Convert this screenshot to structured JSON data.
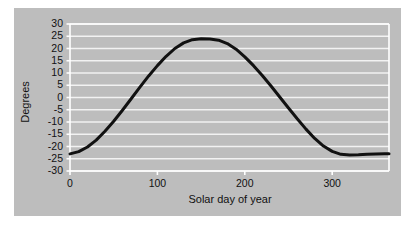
{
  "figure": {
    "background_color": "#ffffff",
    "panel_color": "#bdbdbd",
    "grid_color": "#f2f2f2",
    "axis_color": "#ffffff",
    "line_color": "#111111",
    "text_color": "#111111"
  },
  "chart_data": {
    "type": "line",
    "title": "",
    "subtitle": "",
    "xlabel": "Solar day of year",
    "ylabel": "Degrees",
    "xlim": [
      0,
      365
    ],
    "ylim": [
      -30,
      30
    ],
    "xticks": [
      0,
      100,
      200,
      300
    ],
    "xtick_labels": [
      "0",
      "100",
      "200",
      "300"
    ],
    "yticks": [
      30,
      25,
      20,
      15,
      10,
      5,
      0,
      -5,
      -10,
      -15,
      -20,
      -25,
      -30
    ],
    "ytick_labels": [
      "30",
      "25",
      "20",
      "15",
      "10",
      "5",
      "0",
      "-5",
      "-10",
      "-15",
      "-20",
      "-25",
      "-30"
    ],
    "grid": true,
    "grid_axis": "y",
    "legend": false,
    "legend_position": "none",
    "annotations": [],
    "series": [
      {
        "name": "Solar declination",
        "line_color": "#111111",
        "line_width": 3.0,
        "x": [
          0,
          10,
          20,
          30,
          40,
          50,
          60,
          70,
          80,
          90,
          100,
          110,
          120,
          130,
          140,
          150,
          160,
          170,
          180,
          190,
          200,
          210,
          220,
          230,
          240,
          250,
          260,
          270,
          280,
          290,
          300,
          310,
          320,
          330,
          340,
          350,
          360,
          365
        ],
        "values": [
          -23.0,
          -22.1,
          -20.2,
          -17.4,
          -13.8,
          -9.7,
          -5.2,
          -0.5,
          4.2,
          8.8,
          13.0,
          16.8,
          20.0,
          22.3,
          23.6,
          24.0,
          23.9,
          23.4,
          22.0,
          19.7,
          16.6,
          13.0,
          9.0,
          4.7,
          0.2,
          -4.3,
          -8.7,
          -12.9,
          -16.7,
          -19.8,
          -22.0,
          -23.2,
          -23.5,
          -23.4,
          -23.2,
          -23.1,
          -23.0,
          -23.0
        ]
      }
    ]
  }
}
